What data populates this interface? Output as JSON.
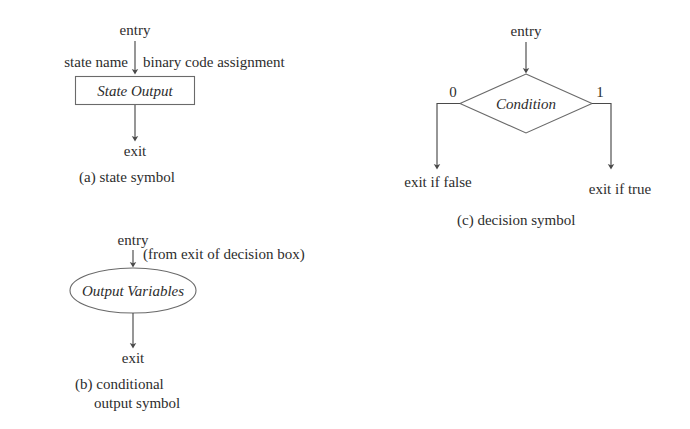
{
  "figure": {
    "type": "diagram",
    "subtype": "asm-chart-symbols",
    "background": "#ffffff",
    "ink_color": "#2d2d2d",
    "line_color": "#4a4a4a"
  },
  "panels": {
    "a": {
      "caption": "(a) state symbol",
      "entry_label": "entry",
      "exit_label": "exit",
      "left_annotation": "state name",
      "right_annotation": "binary code assignment",
      "symbol_text": "State Output",
      "symbol_shape": "rectangle"
    },
    "b": {
      "caption_line1": "(b) conditional",
      "caption_line2": "output symbol",
      "entry_label": "entry",
      "exit_label": "exit",
      "entry_annotation": "(from exit of decision box)",
      "symbol_text": "Output Variables",
      "symbol_shape": "ellipse"
    },
    "c": {
      "caption": "(c) decision symbol",
      "entry_label": "entry",
      "symbol_text": "Condition",
      "symbol_shape": "diamond",
      "branch_false_value": "0",
      "branch_true_value": "1",
      "exit_false_label": "exit if false",
      "exit_true_label": "exit if true"
    }
  }
}
